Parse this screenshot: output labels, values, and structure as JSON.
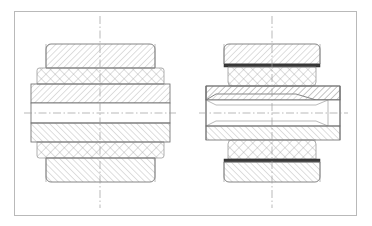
{
  "document": {
    "type": "engineering-cross-section-drawing",
    "title": "",
    "width": 372,
    "height": 226,
    "background_color": "#ffffff",
    "view_count": 2,
    "units": "",
    "annotations": [],
    "dimensions_shown": []
  },
  "frame": {
    "name": "drawing-border",
    "x": 14,
    "y": 11,
    "width": 343,
    "height": 205,
    "stroke_color": "#b9b9b9",
    "stroke_width": 1,
    "fill": "none"
  },
  "style": {
    "outline_color": "#6f6f6f",
    "thin_line_color": "#8c8c8c",
    "hatch_color": "#9a9a9a",
    "mesh_color": "#a0a0a0",
    "seal_color": "#3a3a3a",
    "centerline_color": "#9b9b9b",
    "centerline_dash": "7,2.5,1.5,2.5",
    "hatch_spacing": 3.1,
    "mesh_spacing": 4.6,
    "outline_width": 0.85,
    "thin_width": 0.6
  },
  "views": [
    {
      "id": "left-view",
      "name": "Left bearing assembly cross-section",
      "label": "",
      "center_x": 100,
      "center_y": 113,
      "vertical_centerline": {
        "x": 100,
        "y_top": 16,
        "y_bottom": 208
      },
      "horizontal_centerline": {
        "y": 113,
        "x_left": 24,
        "x_right": 176
      },
      "body_left": 31,
      "body_right": 170,
      "bore_top": 103,
      "bore_bottom": 123,
      "layers": [
        {
          "name": "outer-race-top",
          "hatch": "diagonal-right",
          "y1": 44,
          "y2": 68,
          "x1": 46,
          "x2": 155,
          "corner_radius": 5
        },
        {
          "name": "roller-cage-mesh-top",
          "hatch": "cross-mesh",
          "y1": 68,
          "y2": 84,
          "x1": 37,
          "x2": 164,
          "corner_radius": 2.5
        },
        {
          "name": "inner-race-top",
          "hatch": "diagonal-right",
          "y1": 84,
          "y2": 103,
          "x1": 31,
          "x2": 170,
          "corner_radius": 0
        },
        {
          "name": "bore-cavity",
          "hatch": "none",
          "y1": 103,
          "y2": 123,
          "x1": 31,
          "x2": 170,
          "corner_radius": 0
        },
        {
          "name": "inner-race-bottom",
          "hatch": "diagonal-left",
          "y1": 123,
          "y2": 142,
          "x1": 31,
          "x2": 170,
          "corner_radius": 0
        },
        {
          "name": "roller-cage-mesh-bottom",
          "hatch": "cross-mesh",
          "y1": 142,
          "y2": 158,
          "x1": 37,
          "x2": 164,
          "corner_radius": 2.5
        },
        {
          "name": "outer-race-bottom",
          "hatch": "diagonal-left",
          "y1": 158,
          "y2": 182,
          "x1": 46,
          "x2": 155,
          "corner_radius": 5
        }
      ],
      "seal_bands": []
    },
    {
      "id": "right-view",
      "name": "Right bushing assembly cross-section with seals",
      "label": "",
      "center_x": 272,
      "center_y": 113,
      "vertical_centerline": {
        "x": 272,
        "y_top": 16,
        "y_bottom": 208
      },
      "horizontal_centerline": {
        "y": 113,
        "x_left": 199,
        "x_right": 348
      },
      "body_left": 206,
      "body_right": 340,
      "bore_top": 100,
      "bore_bottom": 126,
      "layers": [
        {
          "name": "outer-housing-top",
          "hatch": "diagonal-right",
          "y1": 44,
          "y2": 64,
          "x1": 224,
          "x2": 320,
          "corner_radius": 5
        },
        {
          "name": "seal-band-top",
          "hatch": "solid",
          "y1": 64,
          "y2": 67,
          "x1": 224,
          "x2": 320,
          "corner_radius": 0
        },
        {
          "name": "packing-mesh-top",
          "hatch": "cross-mesh",
          "y1": 67,
          "y2": 86,
          "x1": 228,
          "x2": 316,
          "corner_radius": 4
        },
        {
          "name": "flange-sleeve-top",
          "hatch": "diagonal-right",
          "y1": 86,
          "y2": 100,
          "x1": 206,
          "x2": 340,
          "corner_radius": 0
        },
        {
          "name": "bore-cavity",
          "hatch": "none",
          "y1": 100,
          "y2": 126,
          "x1": 206,
          "x2": 340,
          "corner_radius": 0
        },
        {
          "name": "flange-sleeve-bottom",
          "hatch": "diagonal-left",
          "y1": 126,
          "y2": 140,
          "x1": 206,
          "x2": 340,
          "corner_radius": 0
        },
        {
          "name": "packing-mesh-bottom",
          "hatch": "cross-mesh",
          "y1": 140,
          "y2": 159,
          "x1": 228,
          "x2": 316,
          "corner_radius": 4
        },
        {
          "name": "seal-band-bottom",
          "hatch": "solid",
          "y1": 159,
          "y2": 162,
          "x1": 224,
          "x2": 320,
          "corner_radius": 0
        },
        {
          "name": "outer-housing-bottom",
          "hatch": "diagonal-left",
          "y1": 162,
          "y2": 182,
          "x1": 224,
          "x2": 320,
          "corner_radius": 5
        }
      ],
      "seal_bands": [
        {
          "name": "upper-seal",
          "y": 65.5,
          "x1": 224,
          "x2": 320,
          "color": "#3a3a3a"
        },
        {
          "name": "lower-seal",
          "y": 160.5,
          "x1": 224,
          "x2": 320,
          "color": "#3a3a3a"
        }
      ]
    }
  ]
}
